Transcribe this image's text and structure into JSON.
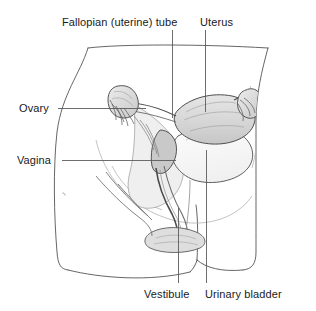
{
  "figure": {
    "background_color": "#ffffff",
    "line_color": "#3a3a3a",
    "organ_fill_color": "#d9d9d9",
    "bladder_fill_color": "#fbfbfb",
    "text_color": "#1a1a1a"
  },
  "labels": {
    "fallopian_tube": "Fallopian (uterine) tube",
    "uterus": "Uterus",
    "ovary": "Ovary",
    "vagina": "Vagina",
    "vestibule": "Vestibule",
    "urinary_bladder": "Urinary bladder"
  },
  "leader_lines": [
    {
      "name": "fallopian-tube-leader",
      "orientation": "vertical",
      "x": 172,
      "y1": 30,
      "y2": 118
    },
    {
      "name": "uterus-leader",
      "orientation": "vertical",
      "x": 205,
      "y1": 30,
      "y2": 112
    },
    {
      "name": "ovary-leader",
      "orientation": "horizontal",
      "y": 108,
      "x1": 58,
      "x2": 146
    },
    {
      "name": "vagina-leader",
      "orientation": "horizontal",
      "y": 160,
      "x1": 62,
      "x2": 176
    },
    {
      "name": "vestibule-leader",
      "orientation": "vertical",
      "x": 178,
      "y1": 208,
      "y2": 283
    },
    {
      "name": "urinary-bladder-leader",
      "orientation": "vertical",
      "x": 206,
      "y1": 150,
      "y2": 283
    }
  ]
}
